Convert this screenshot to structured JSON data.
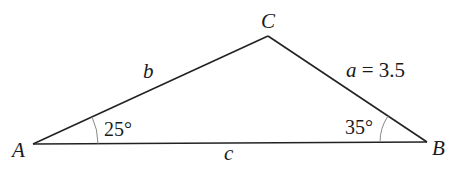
{
  "diagram": {
    "type": "triangle",
    "vertices": {
      "A": {
        "label": "A"
      },
      "B": {
        "label": "B"
      },
      "C": {
        "label": "C"
      }
    },
    "sides": {
      "a": {
        "label": "a = 3.5",
        "var": "a",
        "value": "3.5"
      },
      "b": {
        "label": "b"
      },
      "c": {
        "label": "c"
      }
    },
    "angles": {
      "A": {
        "label": "25°"
      },
      "B": {
        "label": "35°"
      }
    },
    "colors": {
      "line": "#222222",
      "arc": "#888888",
      "text": "#1a1a1a"
    }
  }
}
